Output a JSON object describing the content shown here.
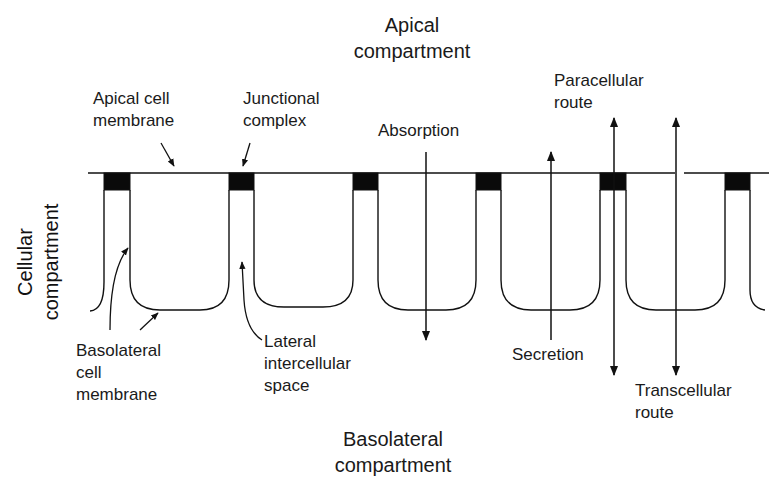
{
  "diagram": {
    "labels": {
      "apical_compartment": [
        "Apical",
        "compartment"
      ],
      "basolateral_compartment": [
        "Basolateral",
        "compartment"
      ],
      "cellular_compartment": [
        "Cellular",
        "compartment"
      ],
      "apical_cell_membrane": [
        "Apical cell",
        "membrane"
      ],
      "junctional_complex": [
        "Junctional",
        "complex"
      ],
      "absorption": [
        "Absorption"
      ],
      "secretion": [
        "Secretion"
      ],
      "paracellular_route": [
        "Paracellular",
        "route"
      ],
      "transcellular_route": [
        "Transcellular",
        "route"
      ],
      "basolateral_cell_membrane": [
        "Basolateral",
        "cell",
        "membrane"
      ],
      "lateral_intercellular_space": [
        "Lateral",
        "intercellular",
        "space"
      ]
    },
    "colors": {
      "line": "#111111",
      "junction_fill": "#0a0a0a",
      "text": "#1a1a1a",
      "background": "#ffffff"
    },
    "junctions_x": [
      104,
      229,
      353,
      476,
      600,
      725
    ],
    "arrows": [
      {
        "name": "absorption",
        "x": 426,
        "direction": "down"
      },
      {
        "name": "secretion",
        "x": 551,
        "direction": "up"
      },
      {
        "name": "paracellular",
        "x": 614,
        "direction": "both"
      },
      {
        "name": "transcellular",
        "x": 676,
        "direction": "both"
      }
    ]
  }
}
